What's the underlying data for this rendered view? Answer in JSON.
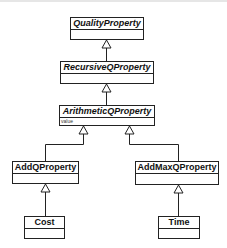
{
  "diagram": {
    "type": "uml-class-hierarchy",
    "classes": [
      {
        "id": "QualityProperty",
        "name": "QualityProperty",
        "abstract": true,
        "attributes": []
      },
      {
        "id": "RecursiveQProperty",
        "name": "RecursiveQProperty",
        "abstract": true,
        "attributes": []
      },
      {
        "id": "ArithmeticQProperty",
        "name": "ArithmeticQProperty",
        "abstract": true,
        "attributes": [
          "value"
        ]
      },
      {
        "id": "AddQProperty",
        "name": "AddQProperty",
        "abstract": false,
        "attributes": []
      },
      {
        "id": "AddMaxQProperty",
        "name": "AddMaxQProperty",
        "abstract": false,
        "attributes": []
      },
      {
        "id": "Cost",
        "name": "Cost",
        "abstract": false,
        "attributes": []
      },
      {
        "id": "Time",
        "name": "Time",
        "abstract": false,
        "attributes": []
      }
    ],
    "generalizations": [
      {
        "child": "RecursiveQProperty",
        "parent": "QualityProperty"
      },
      {
        "child": "ArithmeticQProperty",
        "parent": "RecursiveQProperty"
      },
      {
        "child": "AddQProperty",
        "parent": "ArithmeticQProperty"
      },
      {
        "child": "AddMaxQProperty",
        "parent": "ArithmeticQProperty"
      },
      {
        "child": "Cost",
        "parent": "AddQProperty"
      },
      {
        "child": "Time",
        "parent": "AddMaxQProperty"
      }
    ],
    "colors": {
      "line": "#222222",
      "fill": "#ffffff",
      "text": "#111111"
    }
  }
}
